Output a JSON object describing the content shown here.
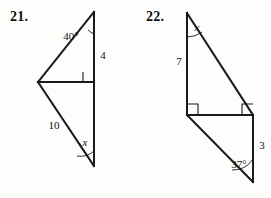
{
  "page": {
    "background_color": "#fdfdfc",
    "ink_color": "#1a1a1a"
  },
  "problems": [
    {
      "number": "21.",
      "figure_name": "two-right-triangles-sharing-vertical-side",
      "labels": {
        "top_angle": "40°",
        "upper_side": "4",
        "lower_hypotenuse": "10",
        "bottom_angle": "x"
      }
    },
    {
      "number": "22.",
      "figure_name": "two-right-triangles-sharing-horizontal-side",
      "labels": {
        "top_angle": "x",
        "left_side": "7",
        "right_side": "3",
        "bottom_angle": "37°"
      }
    }
  ]
}
